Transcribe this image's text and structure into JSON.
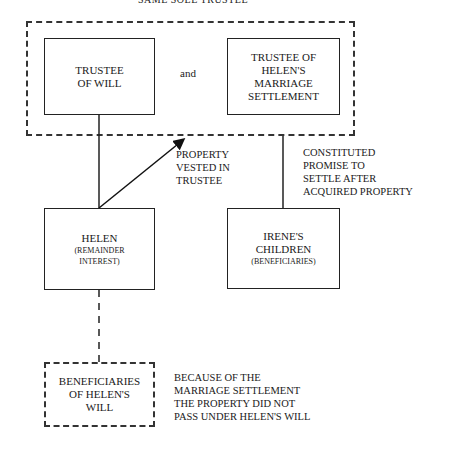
{
  "diagram": {
    "top_title": "SAME SOLE TRUSTEE",
    "group": {
      "left_box": {
        "line1": "TRUSTEE",
        "line2": "OF WILL"
      },
      "connector": "and",
      "right_box": {
        "line1": "TRUSTEE OF",
        "line2": "HELEN'S",
        "line3": "MARRIAGE",
        "line4": "SETTLEMENT"
      }
    },
    "arrow_label": {
      "line1": "PROPERTY",
      "line2": "VESTED IN",
      "line3": "TRUSTEE"
    },
    "promise_label": {
      "line1": "CONSTITUTED",
      "line2": "PROMISE TO",
      "line3": "SETTLE AFTER",
      "line4": "ACQUIRED PROPERTY"
    },
    "helen_box": {
      "title": "HELEN",
      "sub1": "(REMAINDER",
      "sub2": "INTEREST)"
    },
    "irene_box": {
      "line1": "IRENE'S",
      "line2": "CHILDREN",
      "sub": "(BENEFICIARIES)"
    },
    "beneficiaries_box": {
      "line1": "BENEFICIARIES",
      "line2": "OF HELEN'S",
      "line3": "WILL"
    },
    "conclusion": {
      "line1": "BECAUSE OF THE",
      "line2": "MARRIAGE SETTLEMENT",
      "line3": "THE PROPERTY DID NOT",
      "line4": "PASS UNDER HELEN'S WILL"
    }
  }
}
